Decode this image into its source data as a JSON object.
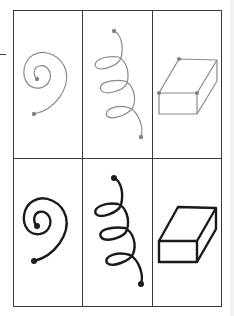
{
  "figure": {
    "rows": [
      {
        "name": "light",
        "stroke": "#8a8a8a",
        "stroke_width": 1.2
      },
      {
        "name": "dark",
        "stroke": "#1a1a1a",
        "stroke_width": 2.4
      }
    ],
    "columns": [
      "spiral",
      "helix",
      "box"
    ],
    "grid_color": "#3a3a3a",
    "point_color": "#777777"
  }
}
